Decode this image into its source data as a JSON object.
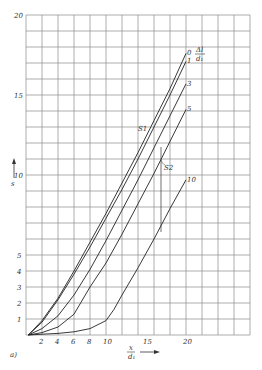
{
  "chart_data": {
    "type": "line",
    "title": "",
    "panel_label": "a)",
    "xlabel": "x / d1",
    "ylabel": "s",
    "xlim": [
      0,
      28
    ],
    "ylim": [
      0,
      20
    ],
    "grid": true,
    "x_ticks": [
      2,
      4,
      6,
      8,
      10,
      15,
      20
    ],
    "y_ticks": [
      1,
      2,
      3,
      4,
      5,
      10,
      15,
      20
    ],
    "legend_title": "Δl / d1",
    "legend_position": "curve-end labels (right)",
    "annotations": [
      "S1",
      "S2"
    ],
    "series": [
      {
        "name": "0",
        "x": [
          0.3,
          2,
          4,
          6,
          8,
          10,
          12,
          14,
          16,
          18,
          20
        ],
        "y": [
          0,
          0.9,
          2.3,
          4.0,
          5.8,
          7.6,
          9.5,
          11.4,
          13.4,
          15.4,
          17.6
        ]
      },
      {
        "name": "1",
        "x": [
          0.3,
          2,
          4,
          6,
          8,
          10,
          12,
          14,
          16,
          18,
          20
        ],
        "y": [
          0,
          0.8,
          2.2,
          3.8,
          5.5,
          7.3,
          9.1,
          11.0,
          13.0,
          15.0,
          17.1
        ]
      },
      {
        "name": "3",
        "x": [
          0.3,
          2,
          4,
          6,
          8,
          10,
          12,
          14,
          16,
          18,
          20
        ],
        "y": [
          0,
          0.4,
          1.2,
          2.5,
          4.1,
          5.9,
          7.8,
          9.7,
          11.7,
          13.7,
          15.7
        ]
      },
      {
        "name": "5",
        "x": [
          0.3,
          2,
          4,
          6,
          8,
          10,
          12,
          14,
          16,
          18,
          20
        ],
        "y": [
          0,
          0.15,
          0.5,
          1.3,
          3.0,
          4.5,
          6.3,
          8.2,
          10.1,
          12.1,
          14.1
        ]
      },
      {
        "name": "10",
        "x": [
          0.3,
          2,
          4,
          6,
          8,
          10,
          11,
          12,
          14,
          16,
          18,
          20
        ],
        "y": [
          0,
          0.05,
          0.1,
          0.2,
          0.4,
          0.9,
          1.6,
          2.5,
          4.2,
          6.0,
          7.9,
          9.7
        ]
      }
    ]
  }
}
